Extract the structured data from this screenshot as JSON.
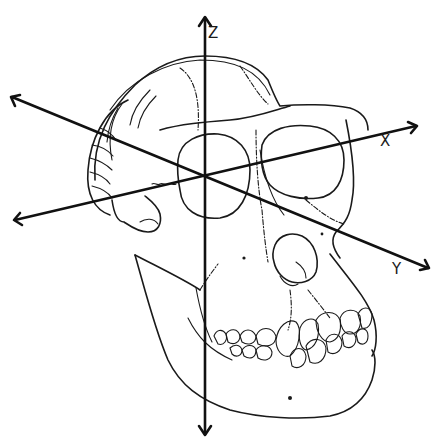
{
  "diagram": {
    "axes": {
      "x": {
        "label": "X"
      },
      "y": {
        "label": "Y"
      },
      "z": {
        "label": "Z"
      }
    },
    "colors": {
      "line": "#1a1a1a",
      "background": "#ffffff"
    }
  }
}
